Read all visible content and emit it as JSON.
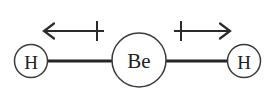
{
  "figure": {
    "name": "beryllium-hydride-dipole-diagram",
    "background_color": "#ffffff",
    "width": 275,
    "height": 99
  },
  "molecule": {
    "formula": "BeH2",
    "geometry": "linear",
    "atoms": [
      {
        "id": "atom-left-h",
        "label": "H",
        "element": "H",
        "cx": 31,
        "cy": 61,
        "r": 16.5,
        "role": "terminal-left"
      },
      {
        "id": "atom-center-be",
        "label": "Be",
        "element": "Be",
        "cx": 139,
        "cy": 60,
        "r": 27,
        "role": "central"
      },
      {
        "id": "atom-right-h",
        "label": "H",
        "element": "H",
        "cx": 244,
        "cy": 61,
        "r": 16.5,
        "role": "terminal-right"
      }
    ],
    "bonds": [
      {
        "id": "bond-left",
        "from": "atom-left-h",
        "to": "atom-center-be",
        "x1": 47,
        "x2": 113,
        "y": 61,
        "order": 1
      },
      {
        "id": "bond-right",
        "from": "atom-center-be",
        "to": "atom-right-h",
        "x1": 166,
        "x2": 228,
        "y": 61,
        "order": 1
      }
    ]
  },
  "dipole_arrows": [
    {
      "id": "dipole-left",
      "direction": "left",
      "tip_x": 44,
      "tail_x": 104,
      "y": 31,
      "cross_x": 97,
      "cross_top_y": 21,
      "cross_bottom_y": 41,
      "meaning": "bond dipole pointing toward H"
    },
    {
      "id": "dipole-right",
      "direction": "right",
      "tip_x": 230,
      "tail_x": 174,
      "y": 31,
      "cross_x": 181,
      "cross_top_y": 21,
      "cross_bottom_y": 41,
      "meaning": "bond dipole pointing toward H"
    }
  ],
  "colors": {
    "stroke_bond": "#252525",
    "stroke_circle": "#3b3b3b",
    "stroke_arrow": "#2a2a2a",
    "text": "#222222",
    "background": "#ffffff"
  }
}
